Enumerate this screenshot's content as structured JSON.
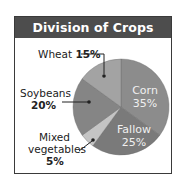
{
  "title": "Division of Crops",
  "chart_data": {
    "type": "pie",
    "title": "Division of Crops",
    "categories": [
      "Corn",
      "Fallow",
      "Mixed vegetables",
      "Soybeans",
      "Wheat"
    ],
    "values": [
      35,
      25,
      5,
      20,
      15
    ],
    "unit": "%",
    "colors": [
      "#8c8c8c",
      "#7a7a7a",
      "#c4c4c4",
      "#858585",
      "#a3a3a3"
    ],
    "labels": {
      "corn": {
        "name": "Corn",
        "value": "35%"
      },
      "fallow": {
        "name": "Fallow",
        "value": "25%"
      },
      "mixed": {
        "name_line1": "Mixed",
        "name_line2": "vegetables",
        "value": "5%"
      },
      "soybeans": {
        "name": "Soybeans",
        "value": "20%"
      },
      "wheat": {
        "name": "Wheat",
        "value": "15%"
      }
    }
  }
}
